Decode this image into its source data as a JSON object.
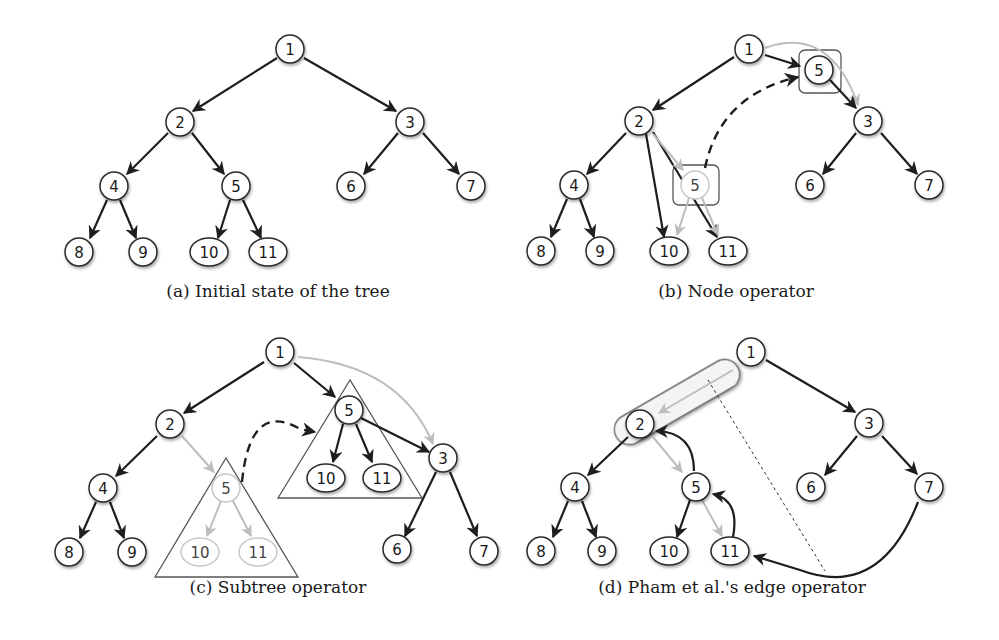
{
  "figure": {
    "panels": [
      {
        "id": "a",
        "caption": "(a) Initial state of the tree",
        "caption_pos": [
          278,
          297
        ],
        "nodes": [
          {
            "label": "1",
            "x": 290,
            "y": 49
          },
          {
            "label": "2",
            "x": 180,
            "y": 122
          },
          {
            "label": "3",
            "x": 410,
            "y": 122
          },
          {
            "label": "4",
            "x": 114,
            "y": 186
          },
          {
            "label": "5",
            "x": 236,
            "y": 186
          },
          {
            "label": "6",
            "x": 351,
            "y": 186
          },
          {
            "label": "7",
            "x": 471,
            "y": 186
          },
          {
            "label": "8",
            "x": 79,
            "y": 252
          },
          {
            "label": "9",
            "x": 143,
            "y": 252
          },
          {
            "label": "10",
            "x": 209,
            "y": 252,
            "oval": true
          },
          {
            "label": "11",
            "x": 268,
            "y": 252,
            "oval": true
          }
        ],
        "edges": [
          {
            "from": [
              277,
              58
            ],
            "to": [
              193,
              111
            ],
            "style": "black"
          },
          {
            "from": [
              304,
              58
            ],
            "to": [
              396,
              111
            ],
            "style": "black"
          },
          {
            "from": [
              168,
              133
            ],
            "to": [
              127,
              174
            ],
            "style": "black"
          },
          {
            "from": [
              192,
              133
            ],
            "to": [
              224,
              174
            ],
            "style": "black"
          },
          {
            "from": [
              398,
              133
            ],
            "to": [
              364,
              174
            ],
            "style": "black"
          },
          {
            "from": [
              423,
              133
            ],
            "to": [
              459,
              174
            ],
            "style": "black"
          },
          {
            "from": [
              107,
              200
            ],
            "to": [
              90,
              238
            ],
            "style": "black"
          },
          {
            "from": [
              120,
              200
            ],
            "to": [
              136,
              238
            ],
            "style": "black"
          },
          {
            "from": [
              230,
              200
            ],
            "to": [
              218,
              238
            ],
            "style": "black"
          },
          {
            "from": [
              243,
              200
            ],
            "to": [
              261,
              238
            ],
            "style": "black"
          }
        ]
      },
      {
        "id": "b",
        "caption": "(b) Node operator",
        "caption_pos": [
          736,
          297
        ],
        "nodes": [
          {
            "label": "1",
            "x": 749,
            "y": 49
          },
          {
            "label": "5",
            "x": 819,
            "y": 70
          },
          {
            "label": "2",
            "x": 639,
            "y": 121
          },
          {
            "label": "3",
            "x": 868,
            "y": 121
          },
          {
            "label": "4",
            "x": 574,
            "y": 185
          },
          {
            "label": "5",
            "x": 695,
            "y": 185,
            "faded": true
          },
          {
            "label": "6",
            "x": 810,
            "y": 185
          },
          {
            "label": "7",
            "x": 929,
            "y": 185
          },
          {
            "label": "8",
            "x": 541,
            "y": 251
          },
          {
            "label": "9",
            "x": 600,
            "y": 251
          },
          {
            "label": "10",
            "x": 669,
            "y": 251,
            "oval": true
          },
          {
            "label": "11",
            "x": 728,
            "y": 251,
            "oval": true
          }
        ],
        "boxes": [
          {
            "x": 799,
            "y": 50,
            "w": 42,
            "h": 43,
            "r": 6
          },
          {
            "x": 673,
            "y": 165,
            "w": 46,
            "h": 40,
            "r": 6
          }
        ],
        "edges": [
          {
            "path": "M 765 48 Q 830 25 858 105",
            "style": "gray",
            "arrow": [
              858,
              105,
              70
            ]
          },
          {
            "from": [
              765,
              55
            ],
            "to": [
              800,
              66
            ],
            "style": "black"
          },
          {
            "from": [
              830,
              80
            ],
            "to": [
              856,
              108
            ],
            "style": "black"
          },
          {
            "from": [
              734,
              57
            ],
            "to": [
              653,
              110
            ],
            "style": "black"
          },
          {
            "from": [
              626,
              133
            ],
            "to": [
              587,
              174
            ],
            "style": "black"
          },
          {
            "from": [
              646,
              134
            ],
            "to": [
              664,
              237
            ],
            "style": "black"
          },
          {
            "from": [
              653,
              132
            ],
            "to": [
              717,
              237
            ],
            "style": "black"
          },
          {
            "from": [
              653,
              134
            ],
            "to": [
              683,
              170
            ],
            "style": "gray"
          },
          {
            "from": [
              689,
              198
            ],
            "to": [
              677,
              235
            ],
            "style": "gray"
          },
          {
            "from": [
              702,
              198
            ],
            "to": [
              718,
              235
            ],
            "style": "gray"
          },
          {
            "path": "M 705 168 Q 720 95 798 77",
            "style": "dashed",
            "arrow": [
              798,
              77,
              -12
            ]
          },
          {
            "from": [
              856,
              133
            ],
            "to": [
              823,
              174
            ],
            "style": "black"
          },
          {
            "from": [
              881,
              133
            ],
            "to": [
              917,
              174
            ],
            "style": "black"
          },
          {
            "from": [
              567,
              199
            ],
            "to": [
              551,
              237
            ],
            "style": "black"
          },
          {
            "from": [
              580,
              199
            ],
            "to": [
              594,
              237
            ],
            "style": "black"
          }
        ]
      },
      {
        "id": "c",
        "caption": "(c) Subtree operator",
        "caption_pos": [
          278,
          593
        ],
        "nodes": [
          {
            "label": "1",
            "x": 280,
            "y": 352
          },
          {
            "label": "5",
            "x": 349,
            "y": 410
          },
          {
            "label": "2",
            "x": 170,
            "y": 424
          },
          {
            "label": "3",
            "x": 443,
            "y": 458
          },
          {
            "label": "4",
            "x": 103,
            "y": 488
          },
          {
            "label": "5",
            "x": 226,
            "y": 488,
            "faded": true
          },
          {
            "label": "10",
            "x": 326,
            "y": 478,
            "oval": true
          },
          {
            "label": "11",
            "x": 382,
            "y": 478,
            "oval": true
          },
          {
            "label": "6",
            "x": 397,
            "y": 549
          },
          {
            "label": "7",
            "x": 484,
            "y": 551
          },
          {
            "label": "8",
            "x": 69,
            "y": 552
          },
          {
            "label": "9",
            "x": 132,
            "y": 552
          },
          {
            "label": "10",
            "x": 200,
            "y": 552,
            "oval": true,
            "faded": true
          },
          {
            "label": "11",
            "x": 258,
            "y": 552,
            "oval": true,
            "faded": true
          }
        ],
        "triangles": [
          {
            "points": "350,380 278,498 422,498"
          },
          {
            "points": "226,458 155,577 298,577"
          }
        ],
        "edges": [
          {
            "path": "M 298 357 Q 400 365 433 444",
            "style": "gray",
            "arrow": [
              433,
              444,
              70
            ]
          },
          {
            "from": [
              294,
              363
            ],
            "to": [
              335,
              397
            ],
            "style": "black"
          },
          {
            "from": [
              264,
              362
            ],
            "to": [
              184,
              413
            ],
            "style": "black"
          },
          {
            "from": [
              361,
              418
            ],
            "to": [
              429,
              452
            ],
            "style": "black"
          },
          {
            "from": [
              343,
              424
            ],
            "to": [
              333,
              462
            ],
            "style": "black"
          },
          {
            "from": [
              356,
              424
            ],
            "to": [
              372,
              462
            ],
            "style": "black"
          },
          {
            "from": [
              182,
              436
            ],
            "to": [
              214,
              472
            ],
            "style": "gray"
          },
          {
            "from": [
              157,
              436
            ],
            "to": [
              116,
              476
            ],
            "style": "black"
          },
          {
            "from": [
              221,
              501
            ],
            "to": [
              207,
              536
            ],
            "style": "gray"
          },
          {
            "from": [
              233,
              501
            ],
            "to": [
              251,
              536
            ],
            "style": "gray"
          },
          {
            "path": "M 242 482 Q 250 400 300 429 L 315 432",
            "style": "dashed",
            "arrow": [
              315,
              432,
              10
            ]
          },
          {
            "from": [
              436,
              472
            ],
            "to": [
              405,
              536
            ],
            "style": "black"
          },
          {
            "from": [
              450,
              472
            ],
            "to": [
              477,
              536
            ],
            "style": "black"
          },
          {
            "from": [
              96,
              502
            ],
            "to": [
              80,
              538
            ],
            "style": "black"
          },
          {
            "from": [
              110,
              502
            ],
            "to": [
              124,
              538
            ],
            "style": "black"
          }
        ]
      },
      {
        "id": "d",
        "caption": "(d) Pham et al.'s edge operator",
        "caption_pos": [
          732,
          593
        ],
        "nodes": [
          {
            "label": "1",
            "x": 751,
            "y": 352
          },
          {
            "label": "2",
            "x": 640,
            "y": 424
          },
          {
            "label": "3",
            "x": 869,
            "y": 423
          },
          {
            "label": "4",
            "x": 575,
            "y": 487
          },
          {
            "label": "5",
            "x": 696,
            "y": 487
          },
          {
            "label": "6",
            "x": 811,
            "y": 487
          },
          {
            "label": "7",
            "x": 929,
            "y": 487
          },
          {
            "label": "8",
            "x": 541,
            "y": 551
          },
          {
            "label": "9",
            "x": 602,
            "y": 551
          },
          {
            "label": "10",
            "x": 669,
            "y": 551,
            "oval": true
          },
          {
            "label": "11",
            "x": 730,
            "y": 551,
            "oval": true
          }
        ],
        "capsule": {
          "cx": 677,
          "cy": 402,
          "w": 140,
          "h": 30,
          "angle": -30
        },
        "edges": [
          {
            "from": [
              733,
              370
            ],
            "to": [
              659,
              413
            ],
            "style": "gray"
          },
          {
            "from": [
              766,
              360
            ],
            "to": [
              855,
              412
            ],
            "style": "black"
          },
          {
            "from": [
              628,
              437
            ],
            "to": [
              588,
              475
            ],
            "style": "black"
          },
          {
            "from": [
              653,
              437
            ],
            "to": [
              682,
              472
            ],
            "style": "gray"
          },
          {
            "path": "M 694 471 Q 694 432 656 431",
            "style": "black",
            "arrow": [
              656,
              431,
              180
            ]
          },
          {
            "path": "M 733 537 Q 740 500 713 494",
            "style": "black",
            "arrow": [
              713,
              494,
              190
            ]
          },
          {
            "from": [
              702,
              500
            ],
            "to": [
              722,
              536
            ],
            "style": "gray"
          },
          {
            "from": [
              690,
              500
            ],
            "to": [
              677,
              537
            ],
            "style": "black"
          },
          {
            "from": [
              857,
              436
            ],
            "to": [
              825,
              475
            ],
            "style": "black"
          },
          {
            "from": [
              882,
              436
            ],
            "to": [
              917,
              474
            ],
            "style": "black"
          },
          {
            "from": [
              568,
              501
            ],
            "to": [
              553,
              537
            ],
            "style": "black"
          },
          {
            "from": [
              582,
              501
            ],
            "to": [
              596,
              537
            ],
            "style": "black"
          },
          {
            "path": "M 918 502 Q 880 600 800 570 L 754 556",
            "style": "black",
            "arrow": [
              754,
              556,
              196
            ]
          },
          {
            "path": "M 708 380 L 825 571",
            "style": "dotted"
          }
        ]
      }
    ]
  }
}
